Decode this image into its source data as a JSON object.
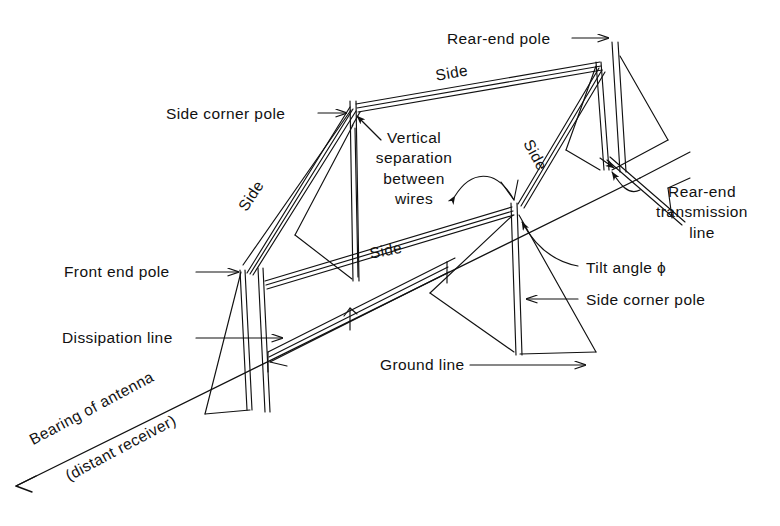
{
  "figure": {
    "type": "engineering-diagram",
    "background_color": "#ffffff",
    "line_color": "#000000",
    "text_color": "#111111"
  },
  "labels": {
    "side_corner_pole_top": "Side corner pole",
    "rear_end_pole": "Rear-end pole",
    "vertical_separation": "Vertical\nseparation\nbetween\nwires",
    "vertical_separation_lines": [
      "Vertical",
      "separation",
      "between",
      "wires"
    ],
    "rear_end_transmission": "Rear-end\ntransmission\nline",
    "rear_end_transmission_lines": [
      "Rear-end",
      "transmission",
      "line"
    ],
    "tilt_angle": "Tilt angle ϕ",
    "side_corner_pole_bottom": "Side corner pole",
    "front_end_pole": "Front end pole",
    "dissipation_line": "Dissipation line",
    "ground_line": "Ground line",
    "bearing_line_1": "Bearing of antenna",
    "bearing_line_2": "(distant receiver)",
    "side_top": "Side",
    "side_left": "Side",
    "side_right": "Side",
    "side_middle": "Side"
  },
  "symbols": {
    "tilt_angle_symbol": "ϕ"
  }
}
